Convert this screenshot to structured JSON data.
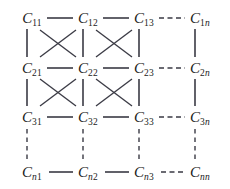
{
  "figure": {
    "type": "diagram",
    "background_color": "#ffffff",
    "line_color": "#3a3a44",
    "text_color": "#1a1a1a",
    "width": 230,
    "height": 189
  },
  "layout": {
    "columns": 4,
    "rows": 4,
    "column_x": [
      32,
      88,
      144,
      200
    ],
    "row_y": [
      18,
      68,
      117,
      172
    ],
    "row_indices": [
      "1",
      "2",
      "3",
      "n"
    ],
    "column_indices": [
      "1",
      "2",
      "3",
      "n"
    ]
  },
  "nodes": [
    {
      "id": "c11",
      "base": "C",
      "row_sub": "1",
      "col_sub": "1",
      "row_sub_italic": false,
      "col_sub_italic": false,
      "x": 32,
      "y": 18,
      "label": "C11"
    },
    {
      "id": "c12",
      "base": "C",
      "row_sub": "1",
      "col_sub": "2",
      "row_sub_italic": false,
      "col_sub_italic": false,
      "x": 88,
      "y": 18,
      "label": "C12"
    },
    {
      "id": "c13",
      "base": "C",
      "row_sub": "1",
      "col_sub": "3",
      "row_sub_italic": false,
      "col_sub_italic": false,
      "x": 144,
      "y": 18,
      "label": "C13"
    },
    {
      "id": "c1n",
      "base": "C",
      "row_sub": "1",
      "col_sub": "n",
      "row_sub_italic": false,
      "col_sub_italic": true,
      "x": 200,
      "y": 18,
      "label": "C1n"
    },
    {
      "id": "c21",
      "base": "C",
      "row_sub": "2",
      "col_sub": "1",
      "row_sub_italic": false,
      "col_sub_italic": false,
      "x": 32,
      "y": 68,
      "label": "C21"
    },
    {
      "id": "c22",
      "base": "C",
      "row_sub": "2",
      "col_sub": "2",
      "row_sub_italic": false,
      "col_sub_italic": false,
      "x": 88,
      "y": 68,
      "label": "C22"
    },
    {
      "id": "c23",
      "base": "C",
      "row_sub": "2",
      "col_sub": "3",
      "row_sub_italic": false,
      "col_sub_italic": false,
      "x": 144,
      "y": 68,
      "label": "C23"
    },
    {
      "id": "c2n",
      "base": "C",
      "row_sub": "2",
      "col_sub": "n",
      "row_sub_italic": false,
      "col_sub_italic": true,
      "x": 200,
      "y": 68,
      "label": "C2n"
    },
    {
      "id": "c31",
      "base": "C",
      "row_sub": "3",
      "col_sub": "1",
      "row_sub_italic": false,
      "col_sub_italic": false,
      "x": 32,
      "y": 117,
      "label": "C31"
    },
    {
      "id": "c32",
      "base": "C",
      "row_sub": "3",
      "col_sub": "2",
      "row_sub_italic": false,
      "col_sub_italic": false,
      "x": 88,
      "y": 117,
      "label": "C32"
    },
    {
      "id": "c33",
      "base": "C",
      "row_sub": "3",
      "col_sub": "3",
      "row_sub_italic": false,
      "col_sub_italic": false,
      "x": 144,
      "y": 117,
      "label": "C33"
    },
    {
      "id": "c3n",
      "base": "C",
      "row_sub": "3",
      "col_sub": "n",
      "row_sub_italic": false,
      "col_sub_italic": true,
      "x": 200,
      "y": 117,
      "label": "C3n"
    },
    {
      "id": "cn1",
      "base": "C",
      "row_sub": "n",
      "col_sub": "1",
      "row_sub_italic": true,
      "col_sub_italic": false,
      "x": 32,
      "y": 172,
      "label": "Cn1"
    },
    {
      "id": "cn2",
      "base": "C",
      "row_sub": "n",
      "col_sub": "2",
      "row_sub_italic": true,
      "col_sub_italic": false,
      "x": 88,
      "y": 172,
      "label": "Cn2"
    },
    {
      "id": "cn3",
      "base": "C",
      "row_sub": "n",
      "col_sub": "3",
      "row_sub_italic": true,
      "col_sub_italic": false,
      "x": 144,
      "y": 172,
      "label": "Cn3"
    },
    {
      "id": "cnn",
      "base": "C",
      "row_sub": "n",
      "col_sub": "n",
      "row_sub_italic": true,
      "col_sub_italic": true,
      "x": 200,
      "y": 172,
      "label": "Cnn"
    }
  ],
  "edges": {
    "horizontal_solid": [
      {
        "from": "c11",
        "to": "c12"
      },
      {
        "from": "c12",
        "to": "c13"
      },
      {
        "from": "c21",
        "to": "c22"
      },
      {
        "from": "c22",
        "to": "c23"
      },
      {
        "from": "c31",
        "to": "c32"
      },
      {
        "from": "c32",
        "to": "c33"
      },
      {
        "from": "cn1",
        "to": "cn2"
      },
      {
        "from": "cn2",
        "to": "cn3"
      }
    ],
    "horizontal_dashed": [
      {
        "from": "c13",
        "to": "c1n"
      },
      {
        "from": "c23",
        "to": "c2n"
      },
      {
        "from": "c33",
        "to": "c3n"
      },
      {
        "from": "cn3",
        "to": "cnn"
      }
    ],
    "vertical_solid": [
      {
        "from": "c11",
        "to": "c21"
      },
      {
        "from": "c12",
        "to": "c22"
      },
      {
        "from": "c13",
        "to": "c23"
      },
      {
        "from": "c1n",
        "to": "c2n"
      },
      {
        "from": "c21",
        "to": "c31"
      },
      {
        "from": "c22",
        "to": "c32"
      },
      {
        "from": "c23",
        "to": "c33"
      },
      {
        "from": "c2n",
        "to": "c3n"
      }
    ],
    "vertical_dashed": [
      {
        "from": "c31",
        "to": "cn1"
      },
      {
        "from": "c32",
        "to": "cn2"
      },
      {
        "from": "c33",
        "to": "cn3"
      },
      {
        "from": "c3n",
        "to": "cnn"
      }
    ],
    "diagonal_solid": [
      {
        "from": "c11",
        "to": "c22"
      },
      {
        "from": "c12",
        "to": "c21"
      },
      {
        "from": "c12",
        "to": "c23"
      },
      {
        "from": "c13",
        "to": "c22"
      },
      {
        "from": "c21",
        "to": "c32"
      },
      {
        "from": "c22",
        "to": "c31"
      },
      {
        "from": "c22",
        "to": "c33"
      },
      {
        "from": "c23",
        "to": "c32"
      }
    ]
  }
}
